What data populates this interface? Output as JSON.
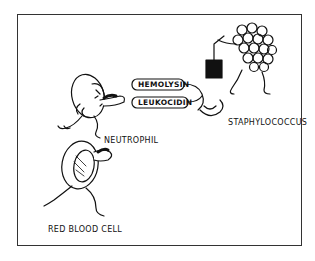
{
  "figure": {
    "type": "cartoon-illustration",
    "labels": {
      "toxin_1": "HEMOLYSIN",
      "toxin_2": "LEUKOCIDIN",
      "bacterium": "STAPHYLOCOCCUS",
      "white_cell": "NEUTROPHIL",
      "red_cell": "RED BLOOD CELL"
    },
    "colors": {
      "ink": "#111111",
      "frame": "#333333",
      "background": "#ffffff"
    }
  }
}
